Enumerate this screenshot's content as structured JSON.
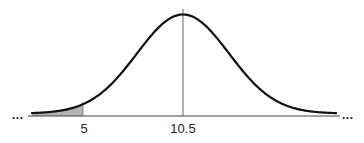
{
  "diagram": {
    "type": "normal-distribution-curve",
    "colors": {
      "curve": "#111111",
      "axis": "#444444",
      "mean_line": "#666666",
      "shaded_area": "#b3b3b3",
      "text": "#222222"
    },
    "axis": {
      "left_continuation": "...",
      "right_continuation": "..."
    },
    "labels": [
      {
        "id": "lower",
        "text": "5",
        "x_px": 83
      },
      {
        "id": "mean",
        "text": "10.5",
        "x_px": 183
      }
    ],
    "mean": 10.5,
    "shaded_region": {
      "description": "left tail area below x = 5",
      "upper_bound": 5
    }
  },
  "chart_data": {
    "type": "area",
    "title": "",
    "xlabel": "",
    "ylabel": "",
    "distribution": "normal",
    "mean": 10.5,
    "tick_labels": [
      "5",
      "10.5"
    ],
    "tick_values": [
      5,
      10.5
    ],
    "shaded_interval": [
      "-inf",
      5
    ],
    "mean_marker": true,
    "grid": false,
    "legend": null
  }
}
